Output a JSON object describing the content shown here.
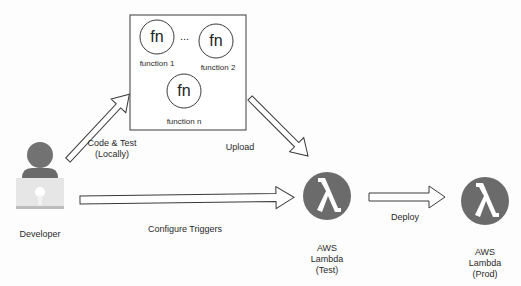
{
  "diagram": {
    "nodes": {
      "developer": {
        "label": "Developer",
        "icon": "person-at-laptop-icon"
      },
      "functions_box": {
        "functions": [
          {
            "glyph": "fn",
            "label": "function 1"
          },
          {
            "glyph": "fn",
            "label": "function 2"
          },
          {
            "glyph": "fn",
            "label": "function n"
          }
        ],
        "ellipsis": "..."
      },
      "lambda_test": {
        "glyph": "λ",
        "line1": "AWS",
        "line2": "Lambda",
        "line3": "(Test)",
        "icon": "aws-lambda-icon"
      },
      "lambda_prod": {
        "glyph": "λ",
        "line1": "AWS",
        "line2": "Lambda",
        "line3": "(Prod)",
        "icon": "aws-lambda-icon"
      }
    },
    "edges": {
      "code_test": {
        "line1": "Code & Test",
        "line2": "(Locally)"
      },
      "upload": {
        "label": "Upload"
      },
      "configure_triggers": {
        "label": "Configure Triggers"
      },
      "deploy": {
        "label": "Deploy"
      }
    },
    "colors": {
      "lambda_fill": "#6b6b6b",
      "developer_head": "#727272",
      "developer_laptop": "#e3e3e3",
      "stroke": "#3a3a3a"
    }
  }
}
